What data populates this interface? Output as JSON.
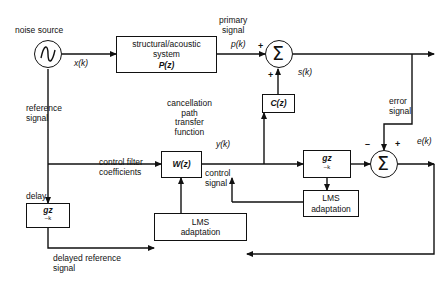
{
  "diagram": {
    "type": "block-diagram",
    "blocks": [
      {
        "id": "plant",
        "label_line1": "structural/acoustic",
        "label_line2": "system",
        "label_line3": "P(z)"
      },
      {
        "id": "cz",
        "label_line1": "C(z)"
      },
      {
        "id": "wz",
        "label_line1": "W(z)"
      },
      {
        "id": "delay",
        "label_line1": "gz^-k"
      },
      {
        "id": "filtered_x",
        "label_line1": "gz^-k"
      },
      {
        "id": "lms_adapt_1",
        "label_line1": "LMS",
        "label_line2": "adaptation"
      },
      {
        "id": "lms_adapt_2",
        "label_line1": "LMS",
        "label_line2": "adaptation"
      }
    ],
    "summers": [
      {
        "id": "sum-primary",
        "signs": [
          "+",
          "+"
        ]
      },
      {
        "id": "sum-error",
        "signs": [
          "-",
          "+"
        ]
      }
    ],
    "labels": {
      "noise_source": "noise source",
      "primary_signal": "primary\nsignal",
      "p_of_k": "p(k)",
      "x_of_k": "x(k)",
      "s_of_k": "s(k)",
      "y_of_k": "y(k)",
      "e_of_k": "e(k)",
      "reference_signal": "reference\nsignal",
      "error_signal": "error\nsignal",
      "cancellation_path": "cancellation\npath\ntransfer\nfunction",
      "control_filter": "control filter\ncoefficients",
      "control_signal": "control\nsignal",
      "delay": "delay",
      "delayed_reference": "delayed reference\nsignal",
      "plant_l1": "structural/acoustic",
      "plant_l2": "system",
      "plant_l3": "P(z)",
      "cz": "C(z)",
      "wz": "W(z)",
      "gz_delay": "gz",
      "gz_exp": "–k",
      "lms_l1": "LMS",
      "lms_l2": "adaptation",
      "plus": "+",
      "minus": "–",
      "sigma": "Σ"
    },
    "colors": {
      "line": "#111111",
      "background": "#ffffff",
      "text": "#111111"
    }
  }
}
